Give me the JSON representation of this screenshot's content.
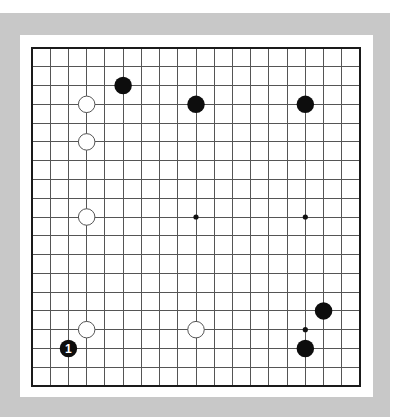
{
  "board": {
    "size": 19,
    "colors": {
      "frame": "#c8c8c8",
      "board_bg": "#ffffff",
      "grid": "#555555",
      "border": "#1a1a1a",
      "black_stone": "#0d0d0d",
      "white_stone": "#ffffff"
    },
    "geometry": {
      "x0": 32,
      "y0": 48,
      "x1": 360,
      "y1": 386
    },
    "star_points_visible": [
      {
        "col": 9,
        "row": 9
      },
      {
        "col": 15,
        "row": 9
      },
      {
        "col": 15,
        "row": 15
      }
    ],
    "stones": [
      {
        "color": "black",
        "col": 5,
        "row": 2,
        "label": ""
      },
      {
        "color": "black",
        "col": 9,
        "row": 3,
        "label": ""
      },
      {
        "color": "black",
        "col": 15,
        "row": 3,
        "label": ""
      },
      {
        "color": "black",
        "col": 16,
        "row": 14,
        "label": ""
      },
      {
        "color": "black",
        "col": 15,
        "row": 16,
        "label": ""
      },
      {
        "color": "black",
        "col": 2,
        "row": 16,
        "label": "1"
      },
      {
        "color": "white",
        "col": 3,
        "row": 3,
        "label": ""
      },
      {
        "color": "white",
        "col": 3,
        "row": 5,
        "label": ""
      },
      {
        "color": "white",
        "col": 3,
        "row": 9,
        "label": ""
      },
      {
        "color": "white",
        "col": 3,
        "row": 15,
        "label": ""
      },
      {
        "color": "white",
        "col": 9,
        "row": 15,
        "label": ""
      }
    ]
  }
}
